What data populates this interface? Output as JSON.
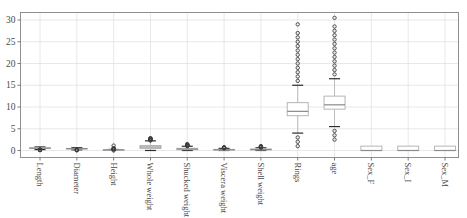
{
  "chart_data": {
    "type": "boxplot",
    "title": "",
    "xlabel": "",
    "ylabel": "",
    "yticks": [
      0,
      5,
      10,
      15,
      20,
      25,
      30
    ],
    "ylim": [
      -1.7,
      31.7
    ],
    "grid": true,
    "categories": [
      "Length",
      "Diameter",
      "Height",
      "Whole weight",
      "Shucked weight",
      "Viscera weight",
      "Shell weight",
      "Rings",
      "age",
      "Sex_F",
      "Sex_I",
      "Sex_M"
    ],
    "columns": [
      {
        "label": "Length",
        "q1": 0.45,
        "median": 0.545,
        "q3": 0.615,
        "whisker_low": 0.205,
        "whisker_high": 0.815,
        "outliers_low": [
          0.075,
          0.11,
          0.13,
          0.15,
          0.165,
          0.18,
          0.195
        ],
        "outliers_high": []
      },
      {
        "label": "Diameter",
        "q1": 0.35,
        "median": 0.425,
        "q3": 0.48,
        "whisker_low": 0.16,
        "whisker_high": 0.65,
        "outliers_low": [
          0.055,
          0.09,
          0.11,
          0.13,
          0.15
        ],
        "outliers_high": []
      },
      {
        "label": "Height",
        "q1": 0.115,
        "median": 0.14,
        "q3": 0.165,
        "whisker_low": 0.04,
        "whisker_high": 0.24,
        "outliers_low": [
          0.0
        ],
        "outliers_high": [
          0.25,
          0.3,
          0.35,
          0.4,
          0.45,
          0.515,
          1.13
        ]
      },
      {
        "label": "Whole weight",
        "q1": 0.4415,
        "median": 0.7995,
        "q3": 1.153,
        "whisker_low": 0.002,
        "whisker_high": 2.22,
        "outliers_low": [],
        "outliers_high": [
          2.3,
          2.4,
          2.5,
          2.555,
          2.61,
          2.657,
          2.7,
          2.78,
          2.8255
        ]
      },
      {
        "label": "Shucked weight",
        "q1": 0.186,
        "median": 0.336,
        "q3": 0.502,
        "whisker_low": 0.001,
        "whisker_high": 0.975,
        "outliers_low": [],
        "outliers_high": [
          1.0,
          1.05,
          1.1,
          1.15,
          1.2,
          1.25,
          1.3,
          1.35,
          1.488
        ]
      },
      {
        "label": "Viscera weight",
        "q1": 0.0935,
        "median": 0.171,
        "q3": 0.253,
        "whisker_low": 0.0005,
        "whisker_high": 0.49,
        "outliers_low": [],
        "outliers_high": [
          0.51,
          0.55,
          0.6,
          0.65,
          0.7,
          0.76
        ]
      },
      {
        "label": "Shell weight",
        "q1": 0.13,
        "median": 0.234,
        "q3": 0.329,
        "whisker_low": 0.0015,
        "whisker_high": 0.6235,
        "outliers_low": [],
        "outliers_high": [
          0.66,
          0.72,
          0.8,
          0.88,
          0.95,
          1.005
        ]
      },
      {
        "label": "Rings",
        "q1": 8,
        "median": 9,
        "q3": 11,
        "whisker_low": 4,
        "whisker_high": 15,
        "outliers_low": [
          1,
          2,
          3
        ],
        "outliers_high": [
          16,
          17,
          18,
          19,
          20,
          21,
          22,
          23,
          24,
          25,
          26,
          27,
          29
        ]
      },
      {
        "label": "age",
        "q1": 9.5,
        "median": 10.5,
        "q3": 12.5,
        "whisker_low": 5.5,
        "whisker_high": 16.5,
        "outliers_low": [
          2.5,
          3.5,
          4.5
        ],
        "outliers_high": [
          17.5,
          18.5,
          19.5,
          20.5,
          21.5,
          22.5,
          23.5,
          24.5,
          25.5,
          26.5,
          27.5,
          28.5,
          30.5
        ]
      },
      {
        "label": "Sex_F",
        "q1": 0,
        "median": 0,
        "q3": 1,
        "whisker_low": 0,
        "whisker_high": 1,
        "outliers_low": [],
        "outliers_high": []
      },
      {
        "label": "Sex_I",
        "q1": 0,
        "median": 0,
        "q3": 1,
        "whisker_low": 0,
        "whisker_high": 1,
        "outliers_low": [],
        "outliers_high": []
      },
      {
        "label": "Sex_M",
        "q1": 0,
        "median": 0,
        "q3": 1,
        "whisker_low": 0,
        "whisker_high": 1,
        "outliers_low": [],
        "outliers_high": []
      }
    ],
    "colors": {
      "background": "#ffffff",
      "grid": "#e2e2e2",
      "plot_border": "#8f8f8f",
      "tick": "#7a7a7a",
      "tick_label": "#4a4a4a",
      "box_edge": "#b5b5b5",
      "box_fill": "#ffffff",
      "median": "#8a8a8a",
      "whisker": "#bdbdbd",
      "cap": "#2b2b2b",
      "outlier": "#3c3c3c"
    },
    "legend": null
  }
}
